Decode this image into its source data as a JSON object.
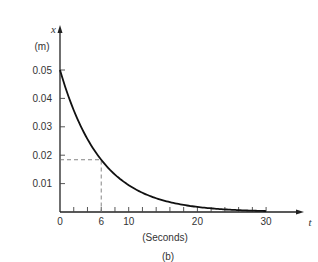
{
  "chart_data": {
    "type": "line",
    "title": "",
    "caption": "(b)",
    "xlabel": "t",
    "xunit": "(Seconds)",
    "ylabel": "x",
    "yunit": "(m)",
    "xlim": [
      0,
      30
    ],
    "ylim": [
      0,
      0.05
    ],
    "grid": false,
    "x_ticks": [
      0,
      6,
      10,
      20,
      30
    ],
    "x_tick_labels": [
      "0",
      "6",
      "10",
      "20",
      "30"
    ],
    "x_minor_ticks": [
      2,
      4,
      6,
      8,
      10,
      12,
      14,
      16,
      18,
      20,
      22,
      24,
      26,
      28,
      30
    ],
    "y_ticks": [
      0.01,
      0.02,
      0.03,
      0.04,
      0.05
    ],
    "y_tick_labels": [
      "0.01",
      "0.02",
      "0.03",
      "0.04",
      "0.05"
    ],
    "series": [
      {
        "name": "x(t)",
        "x": [
          0,
          2,
          4,
          6,
          8,
          10,
          12,
          14,
          16,
          18,
          20,
          22,
          24,
          26,
          28,
          30
        ],
        "values": [
          0.05,
          0.0358,
          0.0257,
          0.0184,
          0.0132,
          0.0094,
          0.0068,
          0.0048,
          0.0035,
          0.0025,
          0.0018,
          0.0013,
          0.0009,
          0.0006,
          0.0005,
          0.0003
        ]
      }
    ],
    "annotations": [
      {
        "type": "dashed-guide",
        "x": 6,
        "y": 0.0184,
        "description": "Dashed lines marking value at t = 6 s"
      }
    ]
  }
}
